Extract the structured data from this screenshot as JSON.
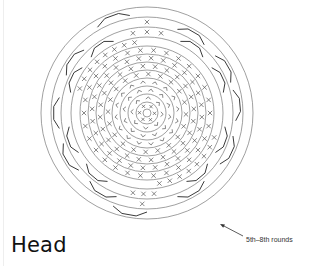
{
  "title": "Head",
  "annotation": {
    "label": "5th–8th rounds",
    "arrow": {
      "from": [
        243,
        236
      ],
      "to": [
        220,
        224
      ]
    }
  },
  "diagram": {
    "type": "crochet-round-chart",
    "center": [
      147,
      113
    ],
    "stroke_color": "#555555",
    "ring_radii": [
      4,
      11,
      19,
      27,
      35,
      43,
      51,
      59,
      67,
      76,
      86,
      96,
      106
    ],
    "stitch_rounds": [
      {
        "symbol": "x",
        "radius": 7.5,
        "count": 6
      },
      {
        "symbol": "v",
        "radius": 15,
        "count": 8
      },
      {
        "symbol": "v",
        "radius": 23,
        "count": 12
      },
      {
        "symbol": "v",
        "radius": 31,
        "count": 16
      },
      {
        "symbol": "x",
        "radius": 39,
        "count": 20
      },
      {
        "symbol": "x",
        "radius": 47,
        "count": 24
      },
      {
        "symbol": "x",
        "radius": 55,
        "count": 28
      },
      {
        "symbol": "x",
        "radius": 63,
        "count": 30
      },
      {
        "symbol": "x",
        "radius": 71.5,
        "count": 8,
        "arc": [
          200,
          260
        ]
      },
      {
        "symbol": "x",
        "radius": 71.5,
        "count": 8,
        "arc": [
          20,
          80
        ]
      },
      {
        "symbol": "x",
        "radius": 81,
        "count": 3,
        "arc": [
          260,
          280
        ]
      },
      {
        "symbol": "x",
        "radius": 91,
        "count": 1,
        "arc": [
          270,
          270
        ]
      },
      {
        "symbol": "x",
        "radius": 81,
        "count": 3,
        "arc": [
          85,
          100
        ]
      },
      {
        "symbol": "x",
        "radius": 91,
        "count": 1,
        "arc": [
          93,
          93
        ]
      }
    ],
    "bracket_marks": [
      {
        "radius": 81,
        "angles": [
          205,
          235,
          305,
          335,
          20,
          50,
          130,
          160
        ]
      },
      {
        "radius": 91,
        "angles": [
          180,
          215,
          300,
          330,
          355,
          25,
          60,
          120,
          150
        ]
      },
      {
        "radius": 101,
        "angles": [
          250,
          100
        ]
      }
    ]
  }
}
